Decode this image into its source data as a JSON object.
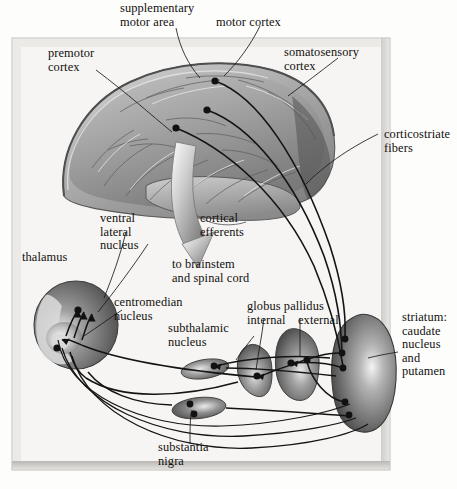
{
  "figure": {
    "background": "#fdfdfc",
    "panel_fill": "#f6f5f3",
    "frame_color": "#d8d6d2",
    "ink": "#12100e"
  },
  "labels": {
    "supplementary_motor_area": "supplementary\nmotor area",
    "motor_cortex": "motor cortex",
    "somatosensory_cortex": "somatosensory\ncortex",
    "premotor_cortex": "premotor\ncortex",
    "corticostriate_fibers": "corticostriate\nfibers",
    "ventral_lateral_nucleus": "ventral\nlateral\nnucleus",
    "thalamus": "thalamus",
    "centromedian_nucleus": "centromedian\nnucleus",
    "cortical_efferents": "cortical\nefferents",
    "to_brainstem_and_spinal_cord": "to brainstem\nand spinal cord",
    "subthalamic_nucleus": "subthalamic\nnucleus",
    "globus_pallidus": "globus pallidus",
    "globus_pallidus_internal": "internal",
    "globus_pallidus_external": "external",
    "striatum": "striatum:\ncaudate\nnucleus\nand\nputamen",
    "substantia_nigra": "substantia\nnigra"
  },
  "structures": [
    {
      "id": "brain",
      "name": "cerebral cortex"
    },
    {
      "id": "thalamus",
      "name": "thalamus"
    },
    {
      "id": "globus-pallidus-internal",
      "name": "globus pallidus internal"
    },
    {
      "id": "globus-pallidus-external",
      "name": "globus pallidus external"
    },
    {
      "id": "striatum",
      "name": "striatum"
    },
    {
      "id": "subthalamic-nucleus",
      "name": "subthalamic nucleus"
    },
    {
      "id": "substantia-nigra",
      "name": "substantia nigra"
    }
  ]
}
